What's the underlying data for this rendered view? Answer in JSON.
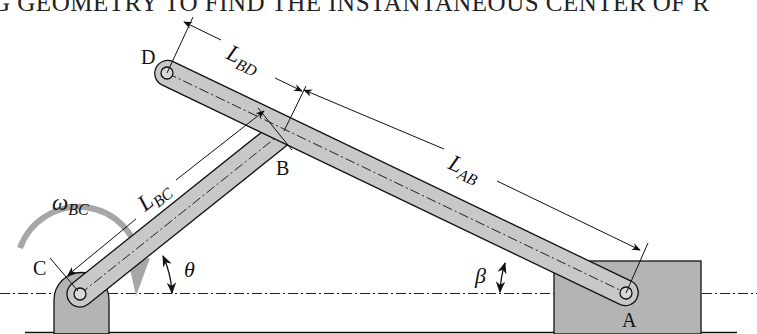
{
  "title": "G GEOMETRY TO FIND THE INSTANTANEOUS CENTER OF R",
  "diagram": {
    "type": "mechanism-linkage",
    "points": {
      "A": {
        "label": "A",
        "x": 626,
        "y": 293
      },
      "B": {
        "label": "B",
        "x": 284,
        "y": 131
      },
      "C": {
        "label": "C",
        "x": 80,
        "y": 294
      },
      "D": {
        "label": "D",
        "x": 167,
        "y": 73
      }
    },
    "links": [
      {
        "id": "BC",
        "from": "C",
        "to": "B"
      },
      {
        "id": "DA",
        "from": "D",
        "to": "A"
      }
    ],
    "dimensions": {
      "L_BD": {
        "main": "L",
        "sub": "BD"
      },
      "L_AB": {
        "main": "L",
        "sub": "AB"
      },
      "L_BC": {
        "main": "L",
        "sub": "BC"
      }
    },
    "angles": {
      "theta": "θ",
      "beta": "β"
    },
    "angular_velocity": {
      "main": "ω",
      "sub": "BC"
    },
    "colors": {
      "link_fill": "#c8c8c8",
      "block_fill": "#b4b4b4",
      "arrow_gray": "#a6a6a6",
      "stroke": "#111111"
    }
  }
}
